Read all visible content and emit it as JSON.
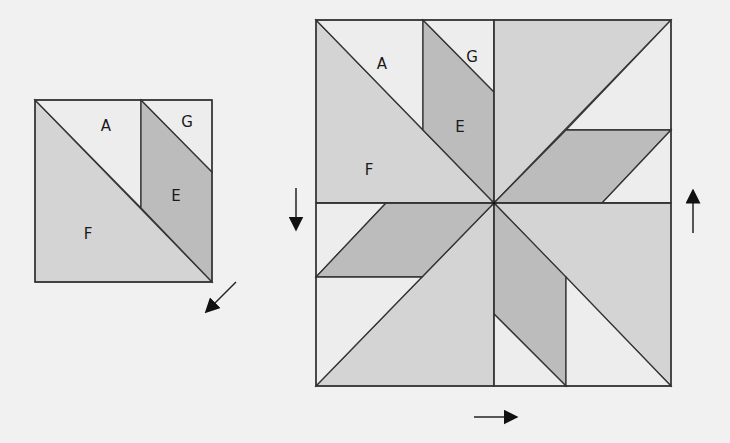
{
  "colors": {
    "background": "#f1f1f1",
    "light": "#ededed",
    "medium": "#d4d4d4",
    "dark": "#bcbcbc",
    "line": "#333333"
  },
  "small_block": {
    "labels": {
      "A": "A",
      "G": "G",
      "E": "E",
      "F": "F"
    },
    "arrow_direction": "down-left"
  },
  "large_block": {
    "labels": {
      "A": "A",
      "G": "G",
      "E": "E",
      "F": "F"
    },
    "arrows": [
      "down",
      "up",
      "right"
    ]
  }
}
